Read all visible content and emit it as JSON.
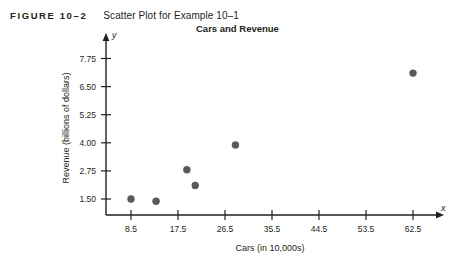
{
  "figure": {
    "number": "FIGURE 10–2",
    "caption": "Scatter Plot for Example 10–1"
  },
  "chart_data": {
    "type": "scatter",
    "title": "Cars and Revenue",
    "xlabel": "Cars (in 10,000s)",
    "ylabel": "Revenue (billions of dollars)",
    "xlim": [
      0,
      67
    ],
    "ylim": [
      0.9,
      8.0
    ],
    "xticks": [
      8.5,
      17.5,
      26.5,
      35.5,
      44.5,
      53.5,
      62.5
    ],
    "xtick_labels": [
      "8.5",
      "17.5",
      "26.5",
      "35.5",
      "44.5",
      "53.5",
      "62.5"
    ],
    "yticks": [
      1.5,
      2.75,
      4.0,
      5.25,
      6.5,
      7.75
    ],
    "ytick_labels": [
      "1.50",
      "2.75",
      "4.00",
      "5.25",
      "6.50",
      "7.75"
    ],
    "grid": false,
    "legend": false,
    "axis_letters": {
      "x": "x",
      "y": "y"
    },
    "marker_color": "#58595b",
    "marker_size": 5,
    "points": [
      {
        "x": 8.5,
        "y": 1.5
      },
      {
        "x": 13.3,
        "y": 1.4
      },
      {
        "x": 19.2,
        "y": 2.8
      },
      {
        "x": 20.8,
        "y": 2.1
      },
      {
        "x": 28.5,
        "y": 3.9
      },
      {
        "x": 62.5,
        "y": 7.1
      }
    ]
  }
}
